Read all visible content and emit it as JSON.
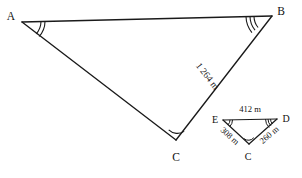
{
  "figure": {
    "background_color": "#ffffff",
    "stroke_color": "#1a1a1a",
    "text_color": "#111111"
  },
  "large_triangle": {
    "name": "triangle-ABC",
    "vertices": [
      {
        "id": "A",
        "label": "A",
        "x": 22,
        "y": 22,
        "label_x": 11,
        "label_y": 20,
        "angle_marks": 2
      },
      {
        "id": "B",
        "label": "B",
        "x": 272,
        "y": 16,
        "label_x": 281,
        "label_y": 15,
        "angle_marks": 3
      },
      {
        "id": "C",
        "label": "C",
        "x": 176,
        "y": 140,
        "label_x": 176,
        "label_y": 161,
        "angle_marks": 1
      }
    ],
    "sides": [
      {
        "id": "BC",
        "label": "1 264 m",
        "from": "B",
        "to": "C",
        "label_x": 205,
        "label_y": 78,
        "rotation": 54
      }
    ]
  },
  "small_triangle": {
    "name": "triangle-EDC",
    "vertices": [
      {
        "id": "E",
        "label": "E",
        "x": 223,
        "y": 120,
        "label_x": 214,
        "label_y": 120,
        "angle_marks": 2
      },
      {
        "id": "D",
        "label": "D",
        "x": 277,
        "y": 119,
        "label_x": 286,
        "label_y": 119,
        "angle_marks": 3
      },
      {
        "id": "C",
        "label": "C",
        "x": 249,
        "y": 144,
        "label_x": 249,
        "label_y": 160,
        "angle_marks": 1
      }
    ],
    "sides": [
      {
        "id": "ED",
        "label": "412 m",
        "from": "E",
        "to": "D",
        "label_x": 250,
        "label_y": 110,
        "rotation": 0
      },
      {
        "id": "EC",
        "label": "308 m",
        "from": "E",
        "to": "C",
        "label_x": 227,
        "label_y": 137,
        "rotation": 42
      },
      {
        "id": "CD",
        "label": "260 m",
        "from": "C",
        "to": "D",
        "label_x": 270,
        "label_y": 137,
        "rotation": -40
      }
    ]
  }
}
